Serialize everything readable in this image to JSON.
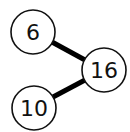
{
  "diagram": {
    "type": "number-bond",
    "whole": {
      "label": "16",
      "cx": 104,
      "cy": 70
    },
    "parts": [
      {
        "label": "6",
        "cx": 33,
        "cy": 32
      },
      {
        "label": "10",
        "cx": 34,
        "cy": 108
      }
    ],
    "colors": {
      "stroke": "#111111",
      "fill": "#ffffff",
      "edge": "#000000"
    }
  }
}
